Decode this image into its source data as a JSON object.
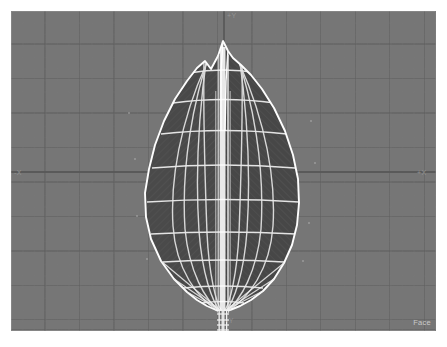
{
  "viewport": {
    "background_color": "#767676",
    "grid_line_color": "#5f5f5f",
    "axis_line_color": "#585858",
    "width": 425,
    "height": 320,
    "grid_cell_px": 34.5
  },
  "axes": {
    "plus_y_label": "+Y",
    "minus_y_label": "-Y",
    "minus_x_label": "-X",
    "plus_x_label": "+X"
  },
  "status": {
    "selection_mode": "Face"
  },
  "model": {
    "name": "leaf-mesh",
    "fill_color": "#4a4a4a",
    "wireframe_color": "#f2f2f2",
    "midrib_color": "#ffffff",
    "outline": "M 212 30 L 207 45 L 200 58 L 194 50 L 186 57 L 176 70 L 164 88 L 153 110 L 144 134 L 138 158 L 134 182 L 135 206 L 140 228 L 150 250 L 163 268 L 176 281 L 186 289 L 196 295 L 205 299 L 212 301 L 219 299 L 229 295 L 240 289 L 252 280 L 263 268 L 273 252 L 281 234 L 286 214 L 288 192 L 287 168 L 282 144 L 274 120 L 263 97 L 251 78 L 240 64 L 230 54 L 222 47 L 217 40 Z",
    "rings_y": [
      62,
      90,
      122,
      156,
      190,
      222,
      252,
      276,
      292
    ],
    "longitudinal_count": 8,
    "stem": {
      "top_y": 300,
      "bottom_y": 318,
      "x": 212,
      "half_width": 4
    }
  }
}
